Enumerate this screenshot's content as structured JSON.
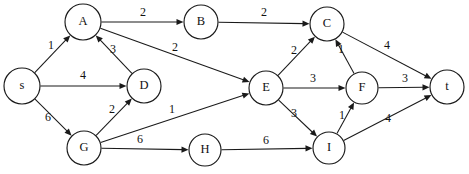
{
  "diagram": {
    "type": "directed-weighted-graph",
    "stroke_color": "#1a1a1a",
    "node_fill": "#ffffff",
    "background": "#ffffff",
    "nodes": [
      {
        "id": "s",
        "label": "s",
        "x": 22,
        "y": 86,
        "r": 18
      },
      {
        "id": "A",
        "label": "A",
        "x": 83,
        "y": 22,
        "r": 18
      },
      {
        "id": "B",
        "label": "B",
        "x": 201,
        "y": 22,
        "r": 17
      },
      {
        "id": "C",
        "label": "C",
        "x": 327,
        "y": 24,
        "r": 17
      },
      {
        "id": "D",
        "label": "D",
        "x": 144,
        "y": 86,
        "r": 17
      },
      {
        "id": "E",
        "label": "E",
        "x": 266,
        "y": 88,
        "r": 17
      },
      {
        "id": "F",
        "label": "F",
        "x": 362,
        "y": 88,
        "r": 16
      },
      {
        "id": "G",
        "label": "G",
        "x": 84,
        "y": 148,
        "r": 17
      },
      {
        "id": "H",
        "label": "H",
        "x": 205,
        "y": 150,
        "r": 16
      },
      {
        "id": "I",
        "label": "I",
        "x": 329,
        "y": 148,
        "r": 16
      },
      {
        "id": "t",
        "label": "t",
        "x": 447,
        "y": 87,
        "r": 17
      }
    ],
    "edges": [
      {
        "from": "s",
        "to": "A",
        "weight": "1",
        "lx": 51,
        "ly": 46
      },
      {
        "from": "s",
        "to": "D",
        "weight": "4",
        "lx": 83,
        "ly": 76
      },
      {
        "from": "s",
        "to": "G",
        "weight": "6",
        "lx": 48,
        "ly": 118
      },
      {
        "from": "A",
        "to": "B",
        "weight": "2",
        "lx": 143,
        "ly": 13
      },
      {
        "from": "A",
        "to": "E",
        "weight": "2",
        "lx": 175,
        "ly": 48
      },
      {
        "from": "D",
        "to": "A",
        "weight": "3",
        "lx": 113,
        "ly": 50
      },
      {
        "from": "G",
        "to": "D",
        "weight": "2",
        "lx": 112,
        "ly": 110
      },
      {
        "from": "G",
        "to": "E",
        "weight": "1",
        "lx": 172,
        "ly": 110
      },
      {
        "from": "G",
        "to": "H",
        "weight": "6",
        "lx": 140,
        "ly": 140
      },
      {
        "from": "B",
        "to": "C",
        "weight": "2",
        "lx": 264,
        "ly": 13
      },
      {
        "from": "E",
        "to": "C",
        "weight": "2",
        "lx": 294,
        "ly": 51
      },
      {
        "from": "E",
        "to": "F",
        "weight": "3",
        "lx": 313,
        "ly": 79
      },
      {
        "from": "E",
        "to": "I",
        "weight": "3",
        "lx": 294,
        "ly": 114
      },
      {
        "from": "F",
        "to": "C",
        "weight": "1",
        "lx": 341,
        "ly": 50
      },
      {
        "from": "I",
        "to": "F",
        "weight": "1",
        "lx": 342,
        "ly": 116
      },
      {
        "from": "H",
        "to": "I",
        "weight": "6",
        "lx": 266,
        "ly": 141
      },
      {
        "from": "C",
        "to": "t",
        "weight": "4",
        "lx": 387,
        "ly": 46
      },
      {
        "from": "F",
        "to": "t",
        "weight": "3",
        "lx": 405,
        "ly": 79
      },
      {
        "from": "I",
        "to": "t",
        "weight": "4",
        "lx": 388,
        "ly": 119
      }
    ]
  }
}
